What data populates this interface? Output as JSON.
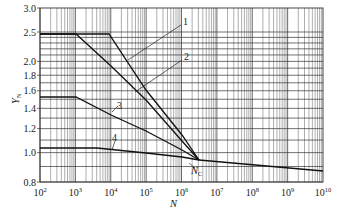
{
  "chart_data": {
    "type": "line",
    "title": "",
    "xlabel": "N",
    "ylabel": "Y_N",
    "xscale": "log",
    "yscale": "log",
    "xlim": [
      100,
      10000000000
    ],
    "ylim": [
      0.8,
      3.0
    ],
    "grid": true,
    "x_ticks": [
      "10^2",
      "10^3",
      "10^4",
      "10^5",
      "10^6",
      "10^7",
      "10^8",
      "10^9",
      "10^10"
    ],
    "y_ticks": [
      "0.8",
      "1.0",
      "1.2",
      "1.4",
      "1.6",
      "1.8",
      "2.0",
      "2.5",
      "3.0"
    ],
    "annotations": [
      {
        "text": "N_C",
        "x": 3000000,
        "y": 1.0,
        "note": "common knee point where curves 1-4 converge"
      }
    ],
    "series": [
      {
        "name": "1",
        "points": [
          [
            100,
            2.5
          ],
          [
            10000,
            2.5
          ],
          [
            100000,
            1.85
          ],
          [
            1000000,
            1.3
          ],
          [
            3000000,
            1.0
          ],
          [
            10000000000,
            0.89
          ]
        ]
      },
      {
        "name": "2",
        "points": [
          [
            100,
            2.5
          ],
          [
            1000,
            2.5
          ],
          [
            10000,
            2.0
          ],
          [
            100000,
            1.55
          ],
          [
            1000000,
            1.18
          ],
          [
            3000000,
            1.0
          ],
          [
            10000000000,
            0.89
          ]
        ]
      },
      {
        "name": "3",
        "points": [
          [
            100,
            1.6
          ],
          [
            1000,
            1.6
          ],
          [
            10000,
            1.45
          ],
          [
            100000,
            1.28
          ],
          [
            1000000,
            1.1
          ],
          [
            3000000,
            1.0
          ],
          [
            10000000000,
            0.89
          ]
        ]
      },
      {
        "name": "4",
        "points": [
          [
            100,
            1.1
          ],
          [
            5000,
            1.1
          ],
          [
            100000,
            1.06
          ],
          [
            1000000,
            1.02
          ],
          [
            3000000,
            1.0
          ],
          [
            10000000000,
            0.89
          ]
        ]
      }
    ]
  },
  "labels": {
    "y_axis": "Y",
    "y_axis_sub": "N",
    "x_axis": "N",
    "nc_main": "N",
    "nc_sub": "C",
    "curve1": "1",
    "curve2": "2",
    "curve3": "3",
    "curve4": "4",
    "xticks": [
      {
        "base": "10",
        "exp": "2"
      },
      {
        "base": "10",
        "exp": "3"
      },
      {
        "base": "10",
        "exp": "4"
      },
      {
        "base": "10",
        "exp": "5"
      },
      {
        "base": "10",
        "exp": "6"
      },
      {
        "base": "10",
        "exp": "7"
      },
      {
        "base": "10",
        "exp": "8"
      },
      {
        "base": "10",
        "exp": "9"
      },
      {
        "base": "10",
        "exp": "10"
      }
    ],
    "yticks": [
      "3.0",
      "2.5",
      "2.0",
      "1.8",
      "1.6",
      "1.4",
      "1.2",
      "1.0",
      "0.8"
    ]
  }
}
